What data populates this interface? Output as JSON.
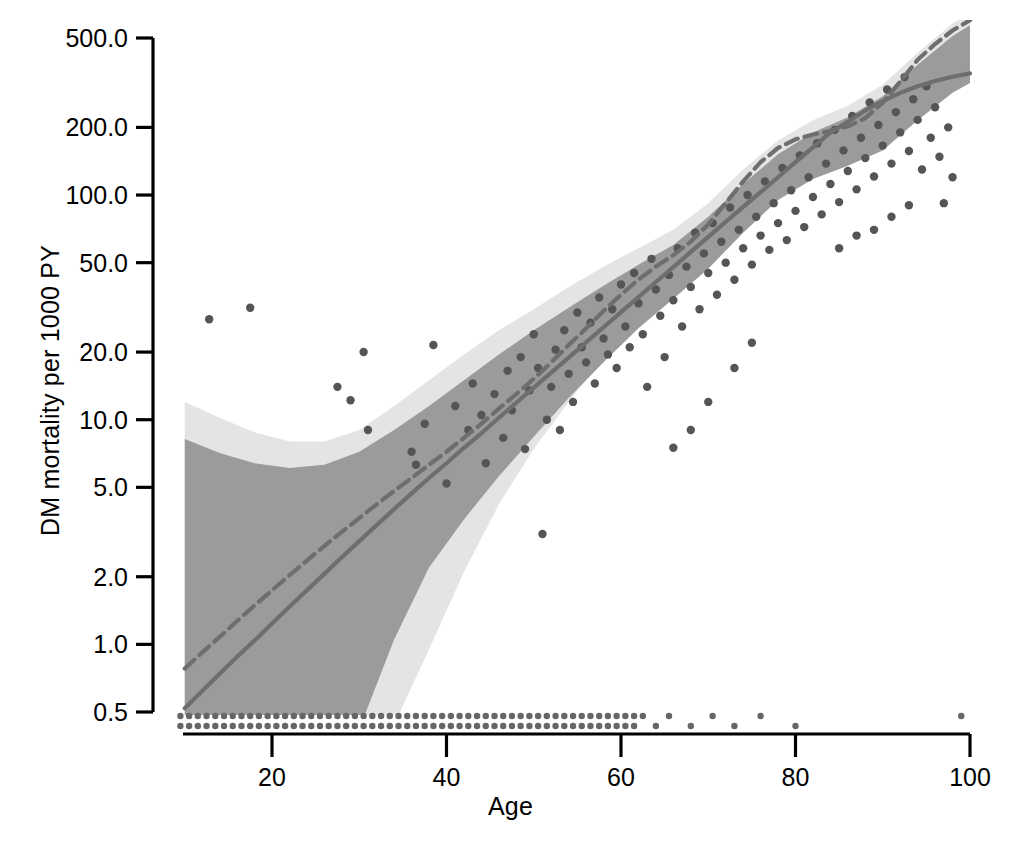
{
  "chart_data": {
    "type": "scatter",
    "title": "",
    "xlabel": "Age",
    "ylabel": "DM mortality per 1000 PY",
    "xlim": [
      8,
      101
    ],
    "ylim": [
      0.42,
      560
    ],
    "yscale": "log",
    "grid": false,
    "legend": "none",
    "xticks": [
      20,
      40,
      60,
      80,
      100
    ],
    "xticklabels": [
      "20",
      "40",
      "60",
      "80",
      "100"
    ],
    "yticks": [
      0.5,
      1.0,
      2.0,
      5.0,
      10.0,
      20.0,
      50.0,
      100.0,
      200.0,
      500.0
    ],
    "yticklabels": [
      "0.5",
      "1.0",
      "2.0",
      "5.0",
      "10.0",
      "20.0",
      "50.0",
      "100.0",
      "200.0",
      "500.0"
    ],
    "series": [
      {
        "name": "spline-fit-curve",
        "type": "line",
        "style": "dashed",
        "color": "#6e6e6e",
        "x": [
          10,
          12,
          14,
          16,
          18,
          20,
          22,
          24,
          26,
          28,
          30,
          32,
          34,
          36,
          38,
          40,
          42,
          44,
          46,
          48,
          50,
          52,
          54,
          56,
          58,
          60,
          62,
          64,
          66,
          68,
          70,
          72,
          74,
          76,
          78,
          80,
          82,
          84,
          86,
          88,
          90,
          92,
          94,
          96,
          98,
          100
        ],
        "y": [
          0.78,
          0.92,
          1.08,
          1.27,
          1.49,
          1.74,
          2.03,
          2.36,
          2.74,
          3.17,
          3.65,
          4.2,
          4.82,
          5.5,
          6.3,
          7.2,
          8.3,
          9.6,
          11.2,
          13.0,
          15.2,
          18.0,
          21.5,
          25.5,
          30.5,
          36.0,
          42.0,
          48.0,
          54.0,
          62.0,
          74.0,
          92.0,
          115.0,
          140.0,
          162.0,
          177.0,
          186.0,
          193.0,
          202.0,
          220.0,
          258.0,
          320.0,
          400.0,
          470.0,
          540.0,
          600.0
        ]
      },
      {
        "name": "linear-fit-curve",
        "type": "line",
        "style": "solid",
        "color": "#6e6e6e",
        "x": [
          10,
          12,
          14,
          16,
          18,
          20,
          22,
          24,
          26,
          28,
          30,
          32,
          34,
          36,
          38,
          40,
          42,
          44,
          46,
          48,
          50,
          52,
          54,
          56,
          58,
          60,
          62,
          64,
          66,
          68,
          70,
          72,
          74,
          76,
          78,
          80,
          82,
          84,
          86,
          88,
          90,
          92,
          94,
          96,
          98,
          100
        ],
        "y": [
          0.52,
          0.62,
          0.74,
          0.88,
          1.04,
          1.24,
          1.47,
          1.74,
          2.06,
          2.44,
          2.88,
          3.4,
          4.0,
          4.7,
          5.5,
          6.4,
          7.5,
          8.7,
          10.2,
          11.9,
          13.9,
          16.2,
          18.9,
          22.1,
          25.8,
          30.1,
          35.1,
          41.0,
          47.8,
          55.8,
          65.1,
          75.9,
          88.5,
          103.0,
          120.0,
          140.0,
          163.0,
          190.0,
          212.0,
          238.0,
          262.0,
          285.0,
          305.0,
          322.0,
          336.0,
          348.0
        ]
      }
    ],
    "bands": [
      {
        "name": "outer-confidence-band",
        "color": "#e4e4e4",
        "x": [
          10,
          14,
          18,
          22,
          26,
          30,
          34,
          38,
          42,
          46,
          50,
          54,
          58,
          62,
          66,
          70,
          74,
          78,
          82,
          86,
          90,
          94,
          98,
          100
        ],
        "y_low": [
          0.42,
          0.42,
          0.42,
          0.42,
          0.42,
          0.42,
          0.44,
          0.95,
          2.1,
          4.2,
          7.4,
          12.0,
          19.0,
          28.0,
          38.0,
          52.0,
          76.0,
          104.0,
          125.0,
          140.0,
          165.0,
          225.0,
          300.0,
          330.0
        ],
        "y_high": [
          12.0,
          10.2,
          8.8,
          8.0,
          8.0,
          9.0,
          11.5,
          15.0,
          19.5,
          25.0,
          31.0,
          39.0,
          48.0,
          58.0,
          70.0,
          92.0,
          130.0,
          175.0,
          215.0,
          250.0,
          310.0,
          430.0,
          580.0,
          650.0
        ]
      },
      {
        "name": "inner-confidence-band",
        "color": "#9b9b9b",
        "x": [
          10,
          14,
          18,
          22,
          26,
          30,
          34,
          38,
          42,
          46,
          50,
          54,
          58,
          62,
          66,
          70,
          74,
          78,
          82,
          86,
          90,
          94,
          98,
          100
        ],
        "y_low": [
          0.42,
          0.42,
          0.42,
          0.42,
          0.42,
          0.42,
          1.05,
          2.2,
          3.6,
          5.6,
          8.4,
          12.5,
          18.0,
          25.5,
          34.5,
          47.0,
          68.0,
          95.0,
          118.0,
          135.0,
          158.0,
          215.0,
          285.0,
          315.0
        ],
        "y_high": [
          8.2,
          7.1,
          6.4,
          6.1,
          6.3,
          7.2,
          9.0,
          11.5,
          15.0,
          19.5,
          25.0,
          31.5,
          39.5,
          49.0,
          60.0,
          80.0,
          112.0,
          152.0,
          190.0,
          222.0,
          275.0,
          380.0,
          510.0,
          570.0
        ]
      }
    ],
    "scatter": {
      "name": "observed-mortality-points",
      "color": "#555555",
      "marker_size": 6,
      "points": [
        [
          12.8,
          28.0
        ],
        [
          17.5,
          31.5
        ],
        [
          27.5,
          14.0
        ],
        [
          29.0,
          12.2
        ],
        [
          31.0,
          9.0
        ],
        [
          30.5,
          20.0
        ],
        [
          36.0,
          7.2
        ],
        [
          36.5,
          6.3
        ],
        [
          37.5,
          9.6
        ],
        [
          38.5,
          21.5
        ],
        [
          40.0,
          5.2
        ],
        [
          41.0,
          11.5
        ],
        [
          42.5,
          9.0
        ],
        [
          43.0,
          14.5
        ],
        [
          44.0,
          10.5
        ],
        [
          44.5,
          6.4
        ],
        [
          45.5,
          13.0
        ],
        [
          46.5,
          8.3
        ],
        [
          47.0,
          16.5
        ],
        [
          47.5,
          11.0
        ],
        [
          48.5,
          19.0
        ],
        [
          49.0,
          7.4
        ],
        [
          49.5,
          13.5
        ],
        [
          50.0,
          24.0
        ],
        [
          50.5,
          17.0
        ],
        [
          51.0,
          3.1
        ],
        [
          51.5,
          10.0
        ],
        [
          52.0,
          14.0
        ],
        [
          52.5,
          20.5
        ],
        [
          53.0,
          9.0
        ],
        [
          53.5,
          25.0
        ],
        [
          54.0,
          16.0
        ],
        [
          54.5,
          12.0
        ],
        [
          55.0,
          30.0
        ],
        [
          55.5,
          21.0
        ],
        [
          56.0,
          18.0
        ],
        [
          56.5,
          27.0
        ],
        [
          57.0,
          14.5
        ],
        [
          57.5,
          35.0
        ],
        [
          58.0,
          23.0
        ],
        [
          58.5,
          19.5
        ],
        [
          59.0,
          31.0
        ],
        [
          59.5,
          17.0
        ],
        [
          60.0,
          40.0
        ],
        [
          60.5,
          26.0
        ],
        [
          61.0,
          21.0
        ],
        [
          61.5,
          45.0
        ],
        [
          62.0,
          33.0
        ],
        [
          62.5,
          24.0
        ],
        [
          63.0,
          14.0
        ],
        [
          63.5,
          52.0
        ],
        [
          64.0,
          38.0
        ],
        [
          64.5,
          29.0
        ],
        [
          65.0,
          19.0
        ],
        [
          65.5,
          44.0
        ],
        [
          66.0,
          34.0
        ],
        [
          66.5,
          58.0
        ],
        [
          67.0,
          26.0
        ],
        [
          67.5,
          48.0
        ],
        [
          68.0,
          39.0
        ],
        [
          68.5,
          68.0
        ],
        [
          69.0,
          31.0
        ],
        [
          69.5,
          55.0
        ],
        [
          70.0,
          45.0
        ],
        [
          70.5,
          75.0
        ],
        [
          71.0,
          36.0
        ],
        [
          71.5,
          62.0
        ],
        [
          72.0,
          50.0
        ],
        [
          72.5,
          88.0
        ],
        [
          73.0,
          42.0
        ],
        [
          73.5,
          70.0
        ],
        [
          74.0,
          58.0
        ],
        [
          74.5,
          100.0
        ],
        [
          75.0,
          49.0
        ],
        [
          75.5,
          80.0
        ],
        [
          76.0,
          66.0
        ],
        [
          76.5,
          115.0
        ],
        [
          77.0,
          57.0
        ],
        [
          77.5,
          92.0
        ],
        [
          78.0,
          75.0
        ],
        [
          78.5,
          132.0
        ],
        [
          79.0,
          63.0
        ],
        [
          79.5,
          105.0
        ],
        [
          80.0,
          85.0
        ],
        [
          80.5,
          150.0
        ],
        [
          81.0,
          72.0
        ],
        [
          81.5,
          120.0
        ],
        [
          82.0,
          98.0
        ],
        [
          82.5,
          170.0
        ],
        [
          83.0,
          82.0
        ],
        [
          83.5,
          138.0
        ],
        [
          84.0,
          112.0
        ],
        [
          84.5,
          195.0
        ],
        [
          85.0,
          93.0
        ],
        [
          85.5,
          158.0
        ],
        [
          86.0,
          128.0
        ],
        [
          86.5,
          225.0
        ],
        [
          87.0,
          106.0
        ],
        [
          87.5,
          180.0
        ],
        [
          88.0,
          146.0
        ],
        [
          88.5,
          258.0
        ],
        [
          89.0,
          121.0
        ],
        [
          89.5,
          205.0
        ],
        [
          90.0,
          166.0
        ],
        [
          90.5,
          295.0
        ],
        [
          91.0,
          138.0
        ],
        [
          91.5,
          234.0
        ],
        [
          92.0,
          190.0
        ],
        [
          92.5,
          335.0
        ],
        [
          93.0,
          157.0
        ],
        [
          93.5,
          267.0
        ],
        [
          94.0,
          216.0
        ],
        [
          94.5,
          130.0
        ],
        [
          95.0,
          305.0
        ],
        [
          95.5,
          180.0
        ],
        [
          96.0,
          246.0
        ],
        [
          96.5,
          148.0
        ],
        [
          97.0,
          92.0
        ],
        [
          97.5,
          200.0
        ],
        [
          98.0,
          120.0
        ],
        [
          85.0,
          58.0
        ],
        [
          87.0,
          66.0
        ],
        [
          89.0,
          70.0
        ],
        [
          91.0,
          80.0
        ],
        [
          93.0,
          90.0
        ],
        [
          66.0,
          7.5
        ],
        [
          68.0,
          9.0
        ],
        [
          70.0,
          12.0
        ],
        [
          73.0,
          17.0
        ],
        [
          75.0,
          22.0
        ]
      ]
    },
    "rug": {
      "name": "zero-event-rug-points",
      "color": "#666666",
      "rows": [
        0.455,
        0.425
      ],
      "x_values": [
        9.5,
        10.5,
        11.5,
        12.5,
        13.5,
        14.5,
        15.5,
        16.5,
        17.5,
        18.5,
        19.5,
        20.5,
        21.5,
        22.5,
        23.5,
        24.5,
        25.5,
        26.5,
        27.5,
        28.5,
        29.5,
        30.5,
        31.5,
        32.5,
        33.5,
        34.5,
        35.5,
        36.5,
        37.5,
        38.5,
        39.5,
        40.5,
        41.5,
        42.5,
        43.5,
        44.5,
        45.5,
        46.5,
        47.5,
        48.5,
        49.5,
        50.5,
        51.5,
        52.5,
        53.5,
        54.5,
        55.5,
        56.5,
        57.5,
        58.5,
        59.5,
        60.5,
        61.5
      ],
      "sparse_x": [
        62.5,
        64.0,
        65.5,
        68.0,
        70.5,
        73.0,
        76.0,
        80.0,
        99.0
      ]
    }
  },
  "axis": {
    "xlabel_text": "Age",
    "ylabel_text": "DM mortality per 1000 PY"
  }
}
